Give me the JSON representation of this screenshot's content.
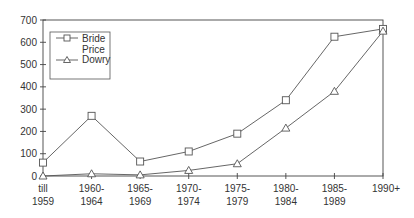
{
  "chart_data": {
    "type": "line",
    "title": "",
    "xlabel": "",
    "ylabel": "",
    "categories": [
      "till 1959",
      "1960-1964",
      "1965-1969",
      "1970-1974",
      "1975-1979",
      "1980-1984",
      "1985-1989",
      "1990+"
    ],
    "category_lines": [
      [
        "till",
        "1959"
      ],
      [
        "1960-",
        "1964"
      ],
      [
        "1965-",
        "1969"
      ],
      [
        "1970-",
        "1974"
      ],
      [
        "1975-",
        "1979"
      ],
      [
        "1980-",
        "1984"
      ],
      [
        "1985-",
        "1989"
      ],
      [
        "1990+",
        ""
      ]
    ],
    "series": [
      {
        "name": "Bride Price",
        "marker": "square",
        "values": [
          60,
          270,
          65,
          110,
          190,
          340,
          625,
          660
        ]
      },
      {
        "name": "Dowry",
        "marker": "triangle",
        "values": [
          0,
          10,
          5,
          25,
          55,
          215,
          380,
          650
        ]
      }
    ],
    "ylim": [
      0,
      700
    ],
    "yticks": [
      0,
      100,
      200,
      300,
      400,
      500,
      600,
      700
    ],
    "grid": false,
    "legend": {
      "position": "upper-left-inside",
      "entries": [
        "Bride Price",
        "Dowry"
      ]
    }
  },
  "legend": {
    "bride_line1": "Bride",
    "bride_line2": "Price",
    "dowry": "Dowry"
  },
  "colors": {
    "line": "#555555",
    "axis": "#444444",
    "text": "#333333"
  }
}
